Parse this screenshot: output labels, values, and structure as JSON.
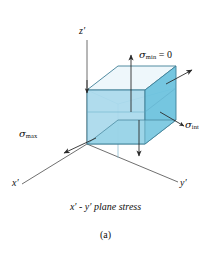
{
  "figure": {
    "caption_main_prefix": "x",
    "caption_main": "x′ - y′ plane stress",
    "caption_sub": "(a)",
    "axes": {
      "z": "z′",
      "x": "x′",
      "y": "y′"
    },
    "labels": {
      "sigma_min": {
        "symbol": "σ",
        "subscript": "min",
        "suffix": " = 0",
        "full": "σmin = 0"
      },
      "sigma_int": {
        "symbol": "σ",
        "subscript": "int",
        "suffix": "",
        "full": "σint"
      },
      "sigma_max": {
        "symbol": "σ",
        "subscript": "max",
        "suffix": "",
        "full": "σmax"
      }
    },
    "colors": {
      "face_left": "#a9d9ec",
      "face_right": "#6ec3de",
      "face_top": "#eef7fb",
      "edge": "#3f7f96",
      "axis": "#4a4a4a",
      "text": "#101010",
      "background": "#ffffff"
    }
  }
}
